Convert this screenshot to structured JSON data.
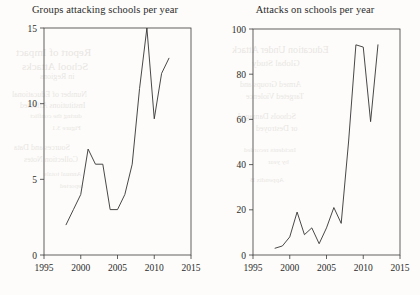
{
  "figure": {
    "background_color": "#fdfcfa",
    "ink_color": "#333333",
    "axis_color": "#3a3a3a"
  },
  "panels": [
    {
      "id": "groups-attacking-schools",
      "title": "Groups attacking schools per year",
      "xlabel": "",
      "ylabel": "",
      "xticks": [
        "1995",
        "2000",
        "2005",
        "2010",
        "2015"
      ],
      "yticks": [
        "0",
        "5",
        "10",
        "15"
      ]
    },
    {
      "id": "attacks-on-schools",
      "title": "Attacks on schools per year",
      "xlabel": "",
      "ylabel": "",
      "xticks": [
        "1995",
        "2000",
        "2005",
        "2010",
        "2015"
      ],
      "yticks": [
        "0",
        "20",
        "40",
        "60",
        "80",
        "100"
      ]
    }
  ],
  "bleed_through": [
    {
      "text": "Report of Impact",
      "x": 16,
      "y": 46,
      "size": 11
    },
    {
      "text": "School Attacks",
      "x": 22,
      "y": 60,
      "size": 11
    },
    {
      "text": "in Regions",
      "x": 40,
      "y": 72,
      "size": 8
    },
    {
      "text": "Number of Educational",
      "x": 12,
      "y": 90,
      "size": 8
    },
    {
      "text": "Institutions Affected",
      "x": 20,
      "y": 101,
      "size": 8
    },
    {
      "text": "during the conflict",
      "x": 30,
      "y": 112,
      "size": 7
    },
    {
      "text": "Figure 3.1",
      "x": 52,
      "y": 124,
      "size": 7
    },
    {
      "text": "Sources and Data",
      "x": 14,
      "y": 143,
      "size": 8
    },
    {
      "text": "Collection Notes",
      "x": 24,
      "y": 155,
      "size": 8
    },
    {
      "text": "Annual totals",
      "x": 44,
      "y": 170,
      "size": 7
    },
    {
      "text": "reported",
      "x": 60,
      "y": 182,
      "size": 7
    },
    {
      "text": "Education Under Attack",
      "x": 232,
      "y": 44,
      "size": 10
    },
    {
      "text": "Global Study",
      "x": 252,
      "y": 58,
      "size": 9
    },
    {
      "text": "Armed Groups and",
      "x": 240,
      "y": 80,
      "size": 8
    },
    {
      "text": "Targeted Violence",
      "x": 246,
      "y": 92,
      "size": 8
    },
    {
      "text": "Schools Damaged",
      "x": 238,
      "y": 112,
      "size": 8
    },
    {
      "text": "or Destroyed",
      "x": 256,
      "y": 124,
      "size": 8
    },
    {
      "text": "Incidents recorded",
      "x": 244,
      "y": 146,
      "size": 7
    },
    {
      "text": "by year",
      "x": 268,
      "y": 158,
      "size": 7
    },
    {
      "text": "Appendix B",
      "x": 250,
      "y": 176,
      "size": 7
    }
  ],
  "chart_data": [
    {
      "type": "line",
      "title": "Groups attacking schools per year",
      "xlabel": "",
      "ylabel": "",
      "xlim": [
        1995,
        2015
      ],
      "ylim": [
        0,
        15
      ],
      "xticks": [
        1995,
        2000,
        2005,
        2010,
        2015
      ],
      "yticks": [
        0,
        5,
        10,
        15
      ],
      "grid": false,
      "legend": "none",
      "x": [
        1998,
        1999,
        2000,
        2001,
        2002,
        2003,
        2004,
        2005,
        2006,
        2007,
        2008,
        2009,
        2010,
        2011,
        2012
      ],
      "values": [
        2,
        3,
        4,
        7,
        6,
        6,
        3,
        3,
        4,
        6,
        11,
        15,
        9,
        12,
        13
      ]
    },
    {
      "type": "line",
      "title": "Attacks on schools per year",
      "xlabel": "",
      "ylabel": "",
      "xlim": [
        1995,
        2015
      ],
      "ylim": [
        0,
        100
      ],
      "xticks": [
        1995,
        2000,
        2005,
        2010,
        2015
      ],
      "yticks": [
        0,
        20,
        40,
        60,
        80,
        100
      ],
      "grid": false,
      "legend": "none",
      "x": [
        1998,
        1999,
        2000,
        2001,
        2002,
        2003,
        2004,
        2005,
        2006,
        2007,
        2008,
        2009,
        2010,
        2011,
        2012
      ],
      "values": [
        3,
        4,
        8,
        19,
        9,
        12,
        5,
        12,
        21,
        14,
        50,
        93,
        92,
        59,
        93
      ]
    }
  ]
}
